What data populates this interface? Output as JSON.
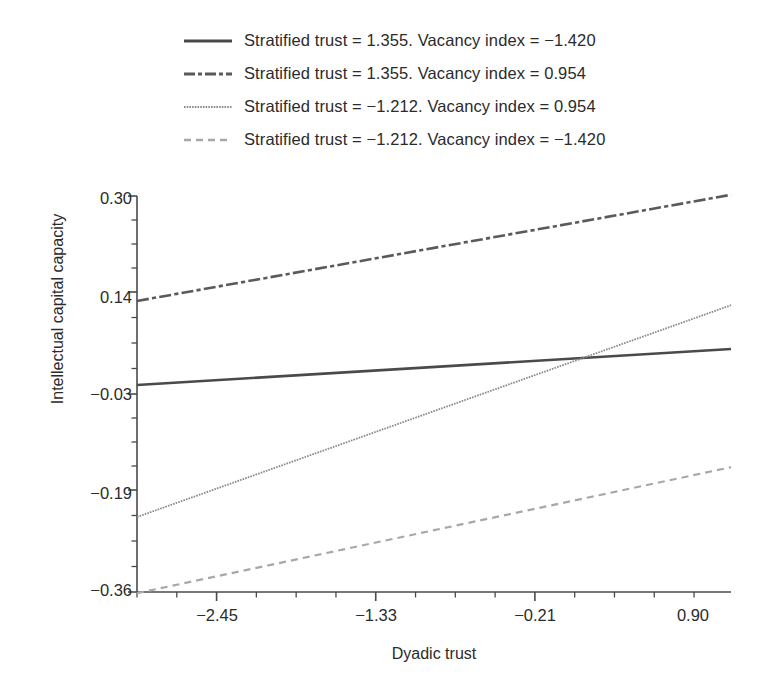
{
  "chart_data": {
    "type": "line",
    "title": "",
    "xlabel": "Dyadic trust",
    "ylabel": "Intellectual capital capacity",
    "xlim": [
      -3.01,
      1.17
    ],
    "ylim": [
      -0.36,
      0.3
    ],
    "xticks": [
      -2.45,
      -1.33,
      -0.21,
      0.9
    ],
    "xtick_labels": [
      "−2.45",
      "−1.33",
      "−0.21",
      "0.90"
    ],
    "yticks": [
      0.3,
      0.14,
      -0.03,
      -0.19,
      -0.36
    ],
    "ytick_labels": [
      "0.30",
      "0.14",
      "−0.03",
      "−0.19",
      "−0.36"
    ],
    "minor_ticks": true,
    "grid": false,
    "legend_position": "above-plot",
    "series": [
      {
        "name": "Stratified trust = 1.355. Vacancy index = −1.420",
        "style": "solid",
        "color": "#4a4a4a",
        "width": 2.6,
        "x": [
          -3.01,
          1.17
        ],
        "y": [
          -0.015,
          0.045
        ]
      },
      {
        "name": "Stratified trust = 1.355. Vacancy index = 0.954",
        "style": "dash-dot",
        "color": "#5a5a5a",
        "width": 2.6,
        "x": [
          -3.01,
          1.17
        ],
        "y": [
          0.125,
          0.302
        ]
      },
      {
        "name": "Stratified trust = −1.212. Vacancy index = 0.954",
        "style": "dotted",
        "color": "#8a8a8a",
        "width": 1.8,
        "x": [
          -3.01,
          1.17
        ],
        "y": [
          -0.235,
          0.118
        ]
      },
      {
        "name": "Stratified trust = −1.212. Vacancy index = −1.420",
        "style": "dashed",
        "color": "#a8a8a8",
        "width": 2.2,
        "x": [
          -3.01,
          1.17
        ],
        "y": [
          -0.362,
          -0.152
        ]
      }
    ]
  },
  "legend": {
    "entries": [
      {
        "label": "Stratified trust = 1.355. Vacancy index = −1.420"
      },
      {
        "label": "Stratified trust = 1.355. Vacancy index = 0.954"
      },
      {
        "label": "Stratified trust = −1.212. Vacancy index = 0.954"
      },
      {
        "label": "Stratified trust = −1.212. Vacancy index = −1.420"
      }
    ]
  },
  "axes": {
    "y_title": "Intellectual capital capacity",
    "x_title": "Dyadic trust",
    "y_labels": [
      "0.30",
      "0.14",
      "−0.03",
      "−0.19",
      "−0.36"
    ],
    "x_labels": [
      "−2.45",
      "−1.33",
      "−0.21",
      "0.90"
    ]
  },
  "colors": {
    "axis": "#4a4a4a",
    "text": "#2b2b2b",
    "series_1": "#4a4a4a",
    "series_2": "#5a5a5a",
    "series_3": "#8a8a8a",
    "series_4": "#a8a8a8",
    "background": "#ffffff"
  }
}
